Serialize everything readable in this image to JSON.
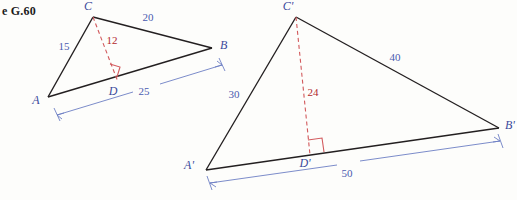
{
  "figure": {
    "caption": "e G.60",
    "colors": {
      "outline": "#231f20",
      "vertex_label": "#3b4a9c",
      "dimension": "#4a5bb0",
      "altitude": "#d2595c",
      "altitude_label": "#b2292e",
      "background": "#fdfdfb"
    }
  },
  "triangle_left": {
    "name": "triangle-abc",
    "vertices": {
      "C": {
        "label": "C",
        "x": 93,
        "y": 17,
        "label_x": 88,
        "label_y": 10
      },
      "B": {
        "label": "B",
        "x": 212,
        "y": 48,
        "label_x": 220,
        "label_y": 49
      },
      "A": {
        "label": "A",
        "x": 48,
        "y": 97,
        "label_x": 36,
        "label_y": 104
      },
      "D": {
        "label": "D",
        "x": 118,
        "y": 82,
        "label_x": 113,
        "label_y": 95
      }
    },
    "measurements": {
      "CB": {
        "value": "20",
        "x": 148,
        "y": 21
      },
      "AC": {
        "value": "15",
        "x": 64,
        "y": 50
      },
      "CD_altitude": {
        "value": "12",
        "x": 112,
        "y": 44
      },
      "AB": {
        "value": "25",
        "x": 144,
        "y": 95
      }
    }
  },
  "triangle_right": {
    "name": "triangle-a-prime-b-prime-c-prime",
    "vertices": {
      "Cp": {
        "label": "C'",
        "x": 296,
        "y": 17,
        "label_x": 288,
        "label_y": 10
      },
      "Bp": {
        "label": "B'",
        "x": 499,
        "y": 128,
        "label_x": 505,
        "label_y": 129
      },
      "Ap": {
        "label": "A'",
        "x": 206,
        "y": 170,
        "label_x": 189,
        "label_y": 169
      },
      "Dp": {
        "label": "D'",
        "x": 310,
        "y": 155,
        "label_x": 305,
        "label_y": 167
      }
    },
    "measurements": {
      "CpBp": {
        "value": "40",
        "x": 395,
        "y": 61
      },
      "ApCp": {
        "value": "30",
        "x": 234,
        "y": 98
      },
      "CpDp_altitude": {
        "value": "24",
        "x": 313,
        "y": 96
      },
      "ApBp": {
        "value": "50",
        "x": 347,
        "y": 177
      }
    }
  }
}
